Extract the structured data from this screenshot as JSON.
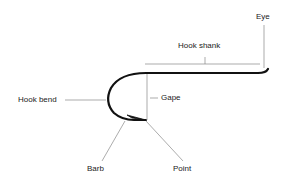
{
  "diagram": {
    "labels": {
      "eye": "Eye",
      "hook_shank": "Hook shank",
      "hook_bend": "Hook bend",
      "gape": "Gape",
      "barb": "Barb",
      "point": "Point"
    },
    "colors": {
      "hook": "#111111",
      "leader": "#888888",
      "text": "#222222"
    }
  }
}
